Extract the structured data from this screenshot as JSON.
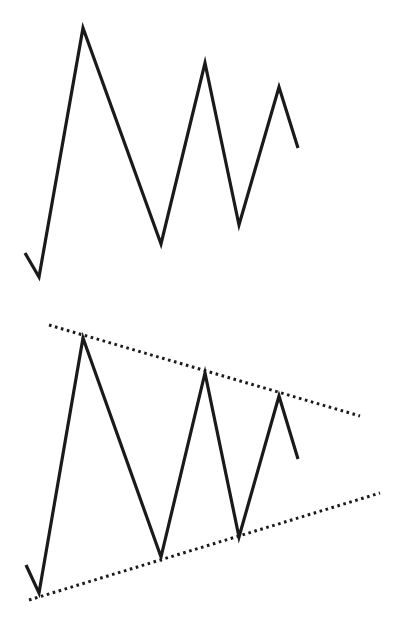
{
  "diagram": {
    "title": "",
    "colors": {
      "line": "#1a1a1a",
      "background": "#ffffff"
    },
    "panels": [
      {
        "name": "price-action",
        "polyline": [
          [
            25,
            253
          ],
          [
            39,
            277
          ],
          [
            83,
            28
          ],
          [
            161,
            244
          ],
          [
            205,
            63
          ],
          [
            239,
            225
          ],
          [
            279,
            87
          ],
          [
            298,
            148
          ]
        ],
        "trendlines": []
      },
      {
        "name": "price-action-with-triangle",
        "polyline": [
          [
            26,
            565
          ],
          [
            39,
            593
          ],
          [
            83,
            338
          ],
          [
            161,
            557
          ],
          [
            205,
            373
          ],
          [
            239,
            537
          ],
          [
            279,
            396
          ],
          [
            298,
            459
          ]
        ],
        "trendlines": [
          {
            "name": "upper-resistance",
            "from": [
              49,
              325
            ],
            "to": [
              360,
              416
            ],
            "style": "dotted"
          },
          {
            "name": "lower-support",
            "from": [
              29,
              600
            ],
            "to": [
              380,
              493
            ],
            "style": "dotted"
          }
        ]
      }
    ]
  }
}
